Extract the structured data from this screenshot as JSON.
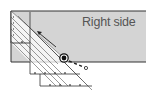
{
  "diagram": {
    "fabric": {
      "label": "Right side",
      "fill": "#d4d4d4",
      "border": "#333333"
    },
    "ruler": {
      "fill": "#ffffff",
      "line": "#444444",
      "orientation": "diagonal-45"
    },
    "cutter_marker": {
      "shape": "circle",
      "color": "#111111"
    },
    "arrows": [
      {
        "name": "cut-direction-arrow",
        "direction": "up-left"
      },
      {
        "name": "pull-arrow",
        "style": "dashed",
        "direction": "down-right"
      }
    ]
  }
}
